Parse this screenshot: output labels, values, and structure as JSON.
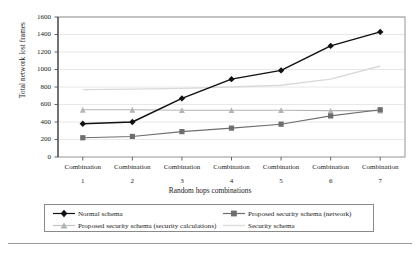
{
  "chart_data": {
    "type": "line",
    "title": "",
    "xlabel": "Random hops combinations",
    "ylabel": "Total network lost frames",
    "categories": [
      "Combination 1",
      "Combination 2",
      "Combination 3",
      "Combination 4",
      "Combination 5",
      "Combination 6",
      "Combination 7"
    ],
    "x_tick_lines": [
      {
        "line1": "Combination",
        "line2": "1"
      },
      {
        "line1": "Combination",
        "line2": "2"
      },
      {
        "line1": "Combination",
        "line2": "3"
      },
      {
        "line1": "Combination",
        "line2": "4"
      },
      {
        "line1": "Combination",
        "line2": "5"
      },
      {
        "line1": "Combination",
        "line2": "6"
      },
      {
        "line1": "Combination",
        "line2": "7"
      }
    ],
    "ylim": [
      0,
      1600
    ],
    "yticks": [
      0,
      200,
      400,
      600,
      800,
      1000,
      1200,
      1400,
      1600
    ],
    "ytick_labels": [
      "0",
      "200",
      "400",
      "600",
      "800",
      "1000",
      "1200",
      "1400",
      "1600"
    ],
    "grid": true,
    "grid_axis": "y",
    "legend_position": "below-plot",
    "series": [
      {
        "name": "Normal schema",
        "key": "normal",
        "marker": "diamond",
        "color": "#111111",
        "values": [
          380,
          400,
          670,
          890,
          990,
          1270,
          1430
        ]
      },
      {
        "name": "Proposed security schema (network)",
        "key": "proposed_network",
        "marker": "square",
        "color": "#6e6e6e",
        "values": [
          220,
          235,
          290,
          330,
          375,
          470,
          540
        ]
      },
      {
        "name": "Proposed security schema (security calculations)",
        "key": "proposed_security_calc",
        "marker": "triangle",
        "color": "#b4b4b4",
        "values": [
          540,
          540,
          535,
          535,
          535,
          530,
          530
        ]
      },
      {
        "name": "Security schema",
        "key": "security",
        "marker": "none",
        "color": "#d9d9d9",
        "values": [
          770,
          775,
          785,
          800,
          820,
          890,
          1040
        ]
      }
    ]
  },
  "legend": {
    "items": [
      {
        "label": "Normal schema"
      },
      {
        "label": "Proposed security schema (network)"
      },
      {
        "label": "Proposed security schema (security calculations)"
      },
      {
        "label": "Security schema"
      }
    ]
  },
  "colors": {
    "axis": "#555555",
    "grid": "#e2e2e2",
    "frame": "#8a8a8a",
    "background": "#ffffff"
  }
}
